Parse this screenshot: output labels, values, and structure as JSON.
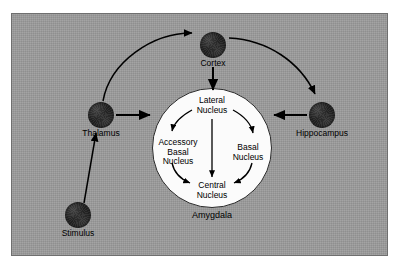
{
  "figure": {
    "background_color": "#ffffff",
    "panel_color": "#9a9a9a",
    "panel_border_color": "#6f6f6f",
    "node_color": "#262626",
    "structure_fill_color": "#fbfbfb",
    "arrow_color": "#000000",
    "text_color": "#000000"
  },
  "nodes": [
    {
      "id": "stimulus",
      "label": "Stimulus",
      "cx": 78,
      "cy": 215,
      "r": 13,
      "label_x": 78,
      "label_y": 231
    },
    {
      "id": "thalamus",
      "label": "Thalamus",
      "cx": 101,
      "cy": 115,
      "r": 13,
      "label_x": 101,
      "label_y": 131
    },
    {
      "id": "cortex",
      "label": "Cortex",
      "cx": 213,
      "cy": 45,
      "r": 13,
      "label_x": 213,
      "label_y": 61
    },
    {
      "id": "hippocampus",
      "label": "Hippocampus",
      "cx": 322,
      "cy": 115,
      "r": 13,
      "label_x": 322,
      "label_y": 131
    }
  ],
  "structure": {
    "id": "amygdala",
    "label": "Amygdala",
    "cx": 212,
    "cy": 148,
    "r": 60,
    "label_x": 212,
    "label_y": 214,
    "nuclei": [
      {
        "id": "lateral-nucleus",
        "lines": [
          "Lateral",
          "Nucleus"
        ],
        "x": 212,
        "y": 100
      },
      {
        "id": "accessory-basal-nucleus",
        "lines": [
          "Accessory",
          "Basal",
          "Nucleus"
        ],
        "x": 178,
        "y": 144
      },
      {
        "id": "basal-nucleus",
        "lines": [
          "Basal",
          "Nucleus"
        ],
        "x": 247,
        "y": 149
      },
      {
        "id": "central-nucleus",
        "lines": [
          "Central",
          "Nucleus"
        ],
        "x": 212,
        "y": 186
      }
    ]
  },
  "connections": [
    {
      "id": "stimulus-to-thalamus",
      "from": "stimulus",
      "to": "thalamus",
      "style": "straight"
    },
    {
      "id": "thalamus-to-cortex",
      "from": "thalamus",
      "to": "cortex",
      "style": "curved"
    },
    {
      "id": "thalamus-to-lateral-nucleus",
      "from": "thalamus",
      "to": "lateral-nucleus",
      "style": "straight"
    },
    {
      "id": "cortex-to-hippocampus",
      "from": "cortex",
      "to": "hippocampus",
      "style": "curved"
    },
    {
      "id": "cortex-to-lateral-nucleus",
      "from": "cortex",
      "to": "lateral-nucleus",
      "style": "straight"
    },
    {
      "id": "hippocampus-to-lateral-nucleus",
      "from": "hippocampus",
      "to": "lateral-nucleus",
      "style": "straight"
    },
    {
      "id": "lateral-to-accessory-basal",
      "from": "lateral-nucleus",
      "to": "accessory-basal-nucleus",
      "style": "curved"
    },
    {
      "id": "lateral-to-basal",
      "from": "lateral-nucleus",
      "to": "basal-nucleus",
      "style": "curved"
    },
    {
      "id": "lateral-to-central",
      "from": "lateral-nucleus",
      "to": "central-nucleus",
      "style": "straight"
    },
    {
      "id": "accessory-basal-to-central",
      "from": "accessory-basal-nucleus",
      "to": "central-nucleus",
      "style": "curved"
    },
    {
      "id": "basal-to-central",
      "from": "basal-nucleus",
      "to": "central-nucleus",
      "style": "curved"
    }
  ]
}
